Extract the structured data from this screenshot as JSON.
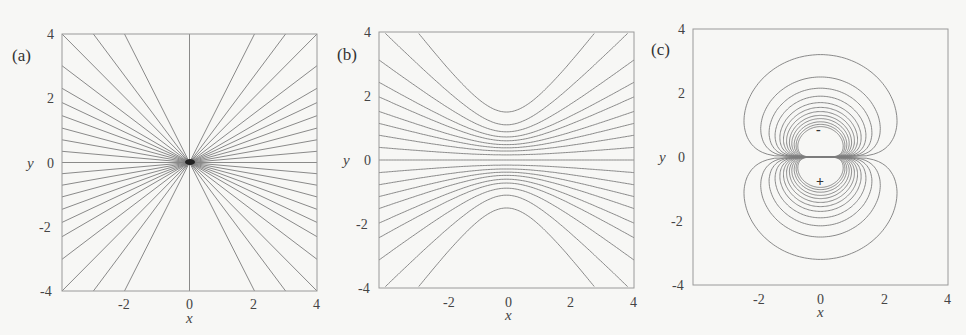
{
  "chart_data": [
    {
      "type": "line",
      "panel_label": "(a)",
      "description": "Radial straight field lines through origin",
      "xlabel": "x",
      "ylabel": "y",
      "xlim": [
        -4,
        4
      ],
      "ylim": [
        -4,
        4
      ],
      "xticks": [
        "-2",
        "0",
        "2",
        "4"
      ],
      "yticks": [
        "4",
        "2",
        "0",
        "-2",
        "-4"
      ],
      "angles_deg": [
        0,
        5,
        10,
        15,
        20,
        25,
        30,
        37,
        45,
        53,
        63,
        90,
        117,
        127,
        135,
        143,
        150,
        155,
        160,
        165,
        170,
        175
      ],
      "grid": false
    },
    {
      "type": "line",
      "panel_label": "(b)",
      "description": "Hyperbolic field lines, y^2 - m^2 x^2 = b^2, asymptotic to lines of panel (a)",
      "xlabel": "x",
      "ylabel": "y",
      "xlim": [
        -4,
        4
      ],
      "ylim": [
        -4,
        4
      ],
      "xticks": [
        "-2",
        "0",
        "2",
        "4"
      ],
      "yticks": [
        "4",
        "2",
        "0",
        "-2",
        "-4"
      ],
      "curves": [
        {
          "slope": 1.33,
          "vertex": 1.5
        },
        {
          "slope": 1.0,
          "vertex": 1.1
        },
        {
          "slope": 0.75,
          "vertex": 0.88
        },
        {
          "slope": 0.58,
          "vertex": 0.72
        },
        {
          "slope": 0.47,
          "vertex": 0.6
        },
        {
          "slope": 0.36,
          "vertex": 0.48
        },
        {
          "slope": 0.27,
          "vertex": 0.38
        },
        {
          "slope": 0.18,
          "vertex": 0.28
        },
        {
          "slope": 0.09,
          "vertex": 0.16
        },
        {
          "slope": 0.0,
          "vertex": 0.0
        }
      ],
      "grid": false
    },
    {
      "type": "line",
      "panel_label": "(c)",
      "description": "Dipole-like closed contours (two lobes) around charges at (0, 0.8) '-' and (0, -0.8) '+'",
      "xlabel": "x",
      "ylabel": "y",
      "xlim": [
        -4,
        4
      ],
      "ylim": [
        -4,
        4
      ],
      "xticks": [
        "-2",
        "0",
        "2",
        "4"
      ],
      "yticks": [
        "4",
        "2",
        "0",
        "-2",
        "-4"
      ],
      "lobe_extents": [
        3.2,
        2.5,
        2.15,
        1.9,
        1.7,
        1.55,
        1.42,
        1.3,
        1.2,
        1.1,
        1.02,
        0.95
      ],
      "markers": [
        {
          "symbol": "-",
          "x": 0,
          "y": 0.8
        },
        {
          "symbol": "+",
          "x": 0,
          "y": -0.8
        }
      ],
      "grid": false
    }
  ],
  "panels": [
    {
      "label": "(a)",
      "xlabel": "x",
      "ylabel": "y",
      "yticks": [
        "4",
        "2",
        "0",
        "-2",
        "-4"
      ],
      "xticks": [
        "-2",
        "0",
        "2",
        "4"
      ]
    },
    {
      "label": "(b)",
      "xlabel": "x",
      "ylabel": "y",
      "yticks": [
        "4",
        "2",
        "0",
        "-2",
        "-4"
      ],
      "xticks": [
        "-2",
        "0",
        "2",
        "4"
      ]
    },
    {
      "label": "(c)",
      "xlabel": "x",
      "ylabel": "y",
      "yticks": [
        "4",
        "2",
        "0",
        "-2",
        "-4"
      ],
      "xticks": [
        "-2",
        "0",
        "2",
        "4"
      ],
      "markers": [
        "-",
        "+"
      ]
    }
  ]
}
